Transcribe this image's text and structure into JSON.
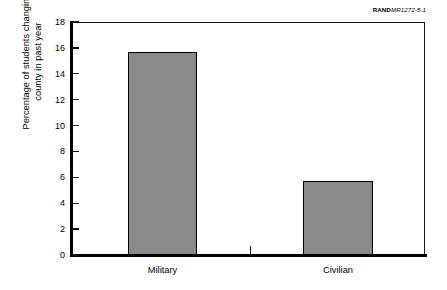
{
  "figure_id": {
    "rand_mark": "RAND",
    "doc_code": "MR1272-5.1"
  },
  "chart_data": {
    "type": "bar",
    "title": "",
    "xlabel": "",
    "ylabel": "Percentage of students changing county in past year",
    "ylabel_lines": [
      "Percentage of students changing",
      "county in past year"
    ],
    "categories": [
      "Military",
      "Civilian"
    ],
    "values": [
      15.7,
      5.7
    ],
    "ylim": [
      0,
      18
    ],
    "ytick_values": [
      0,
      2,
      4,
      6,
      8,
      10,
      12,
      14,
      16,
      18
    ],
    "ytick_labels": [
      "0",
      "2",
      "4",
      "6",
      "8",
      "10",
      "12",
      "14",
      "16",
      "18"
    ],
    "grid": false,
    "legend": "none",
    "bar_fill_color": "#8a8a8a",
    "bar_edge_color": "#000000",
    "axis_color": "#000000",
    "background_color": "#ffffff"
  }
}
